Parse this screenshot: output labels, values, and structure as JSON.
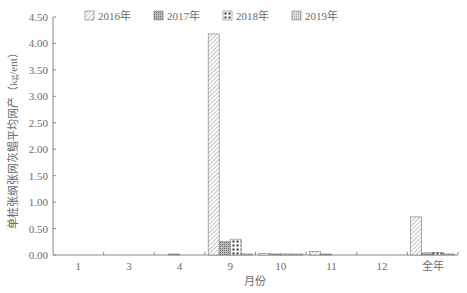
{
  "chart_data": {
    "type": "bar",
    "title": "",
    "xlabel": "月份",
    "ylabel": "单桩张纲张网灰鲳平均网产（kg/ent）",
    "categories": [
      "1",
      "3",
      "4",
      "9",
      "10",
      "11",
      "12",
      "全年"
    ],
    "series": [
      {
        "name": "2016年",
        "pattern": "diagonal-hatch",
        "values": [
          0,
          0,
          0,
          4.18,
          0.03,
          0.07,
          0,
          0.72
        ]
      },
      {
        "name": "2017年",
        "pattern": "dense-crosshatch",
        "values": [
          0,
          0,
          0.01,
          0.25,
          0.01,
          0.01,
          0,
          0.04
        ]
      },
      {
        "name": "2018年",
        "pattern": "checker-dots",
        "values": [
          0,
          0,
          0,
          0.3,
          0.02,
          0,
          0,
          0.05
        ]
      },
      {
        "name": "2019年",
        "pattern": "fine-dots",
        "values": [
          0,
          0,
          0,
          0.02,
          0.01,
          0,
          0,
          0.02
        ]
      }
    ],
    "ylim": [
      0,
      4.5
    ],
    "yticks": [
      "0.00",
      "0.50",
      "1.00",
      "1.50",
      "2.00",
      "2.50",
      "3.00",
      "3.50",
      "4.00",
      "4.50"
    ],
    "grid": false,
    "legend_position": "top"
  },
  "colors": {
    "axis": "#8a8a8a",
    "text": "#6b6b6b",
    "hatch": "#7a7a7a"
  }
}
